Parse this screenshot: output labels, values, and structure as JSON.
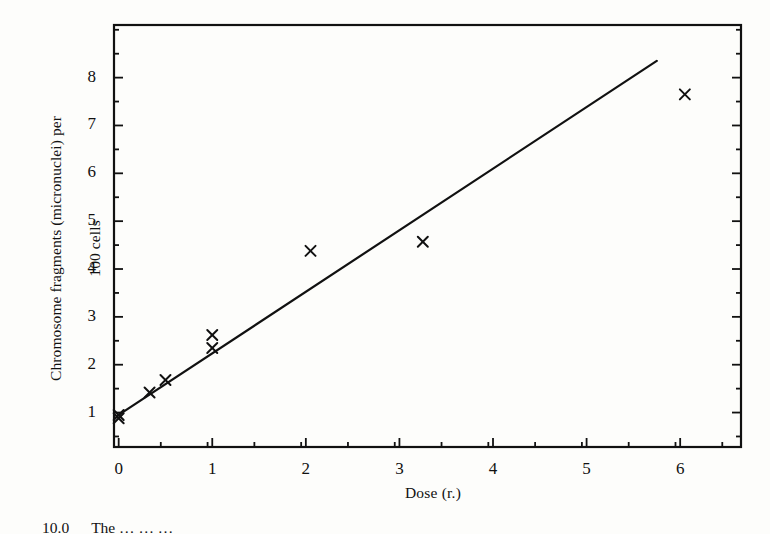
{
  "figure": {
    "background_color": "#fdfdfb",
    "ink_color": "#111111"
  },
  "axes": {
    "xlabel": "Dose (r.)",
    "ylabel_line1": "Chromosome fragments (micronuclei) per",
    "ylabel_line2": "100 cells",
    "xticks": [
      "0",
      "1",
      "2",
      "3",
      "4",
      "5",
      "6"
    ],
    "yticks": [
      "1",
      "2",
      "3",
      "4",
      "5",
      "6",
      "7",
      "8"
    ]
  },
  "caption": {
    "number": "10.0",
    "text": "The … … …"
  },
  "chart_data": {
    "type": "scatter",
    "title": "",
    "xlabel": "Dose (r.)",
    "ylabel": "Chromosome fragments (micronuclei) per 100 cells",
    "xlim": [
      -0.05,
      6.65
    ],
    "ylim": [
      0.28,
      9.1
    ],
    "xticks": [
      0,
      1,
      2,
      3,
      4,
      5,
      6
    ],
    "yticks": [
      1,
      2,
      3,
      4,
      5,
      6,
      7,
      8
    ],
    "x_minor_tick_step": 0.5,
    "y_minor_tick_step": 0.5,
    "grid": false,
    "legend": null,
    "marker": "x",
    "frame": "box",
    "tick_direction": "in",
    "series": [
      {
        "name": "observations",
        "marker": "x",
        "points": [
          {
            "x": 0.0,
            "y": 0.95
          },
          {
            "x": 0.0,
            "y": 0.88
          },
          {
            "x": 0.33,
            "y": 1.42
          },
          {
            "x": 0.5,
            "y": 1.68
          },
          {
            "x": 1.0,
            "y": 2.35
          },
          {
            "x": 1.0,
            "y": 2.62
          },
          {
            "x": 2.05,
            "y": 4.38
          },
          {
            "x": 3.25,
            "y": 4.57
          },
          {
            "x": 6.05,
            "y": 7.65
          }
        ]
      },
      {
        "name": "fitted-regression-line",
        "type": "line",
        "x_start": 0.0,
        "y_start": 0.95,
        "x_end": 5.75,
        "y_end": 8.35,
        "slope": 1.287,
        "intercept": 0.95
      }
    ]
  }
}
